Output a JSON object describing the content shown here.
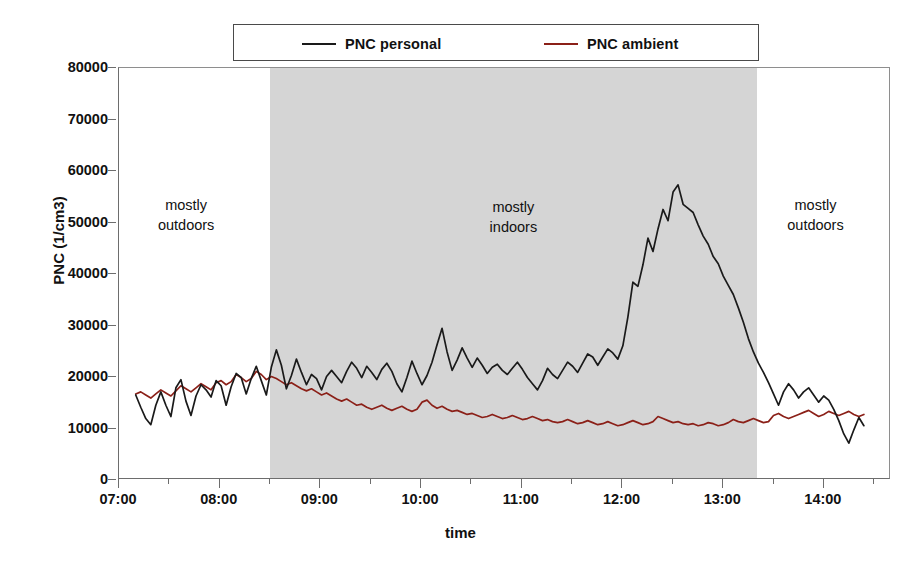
{
  "legend": {
    "entries": [
      {
        "label": "PNC personal",
        "color": "#1a1a1a"
      },
      {
        "label": "PNC ambient",
        "color": "#8b2018"
      }
    ]
  },
  "axes": {
    "y_title": "PNC (1/cm3)",
    "x_title": "time",
    "y_ticks": [
      "0",
      "10000",
      "20000",
      "30000",
      "40000",
      "50000",
      "60000",
      "70000",
      "80000"
    ],
    "x_ticks": [
      "07:00",
      "08:00",
      "09:00",
      "10:00",
      "11:00",
      "12:00",
      "13:00",
      "14:00"
    ]
  },
  "annotations": [
    {
      "line1": "mostly",
      "line2": "outdoors"
    },
    {
      "line1": "mostly",
      "line2": "indoors"
    },
    {
      "line1": "mostly",
      "line2": "outdoors"
    }
  ],
  "chart_data": {
    "type": "line",
    "title": "",
    "xlabel": "time",
    "ylabel": "PNC (1/cm3)",
    "ylim": [
      0,
      80000
    ],
    "xlim": [
      "07:00",
      "14:40"
    ],
    "grid": false,
    "legend_position": "top-center",
    "shaded_region": {
      "label": "mostly indoors",
      "start": "08:30",
      "end": "13:20",
      "color": "#d5d5d5"
    },
    "x_tick_interval_minutes": 60,
    "x_minor_tick_interval_minutes": 30,
    "y_tick_interval": 10000,
    "series": [
      {
        "name": "PNC personal",
        "color": "#1a1a1a",
        "x": [
          "07:10",
          "07:13",
          "07:16",
          "07:19",
          "07:22",
          "07:25",
          "07:28",
          "07:31",
          "07:34",
          "07:37",
          "07:40",
          "07:43",
          "07:46",
          "07:49",
          "07:52",
          "07:55",
          "07:58",
          "08:01",
          "08:04",
          "08:07",
          "08:10",
          "08:13",
          "08:16",
          "08:19",
          "08:22",
          "08:25",
          "08:28",
          "08:31",
          "08:34",
          "08:37",
          "08:40",
          "08:43",
          "08:46",
          "08:49",
          "08:52",
          "08:55",
          "08:58",
          "09:01",
          "09:04",
          "09:07",
          "09:10",
          "09:13",
          "09:16",
          "09:19",
          "09:22",
          "09:25",
          "09:28",
          "09:31",
          "09:34",
          "09:37",
          "09:40",
          "09:43",
          "09:46",
          "09:49",
          "09:52",
          "09:55",
          "09:58",
          "10:01",
          "10:04",
          "10:07",
          "10:10",
          "10:13",
          "10:16",
          "10:19",
          "10:22",
          "10:25",
          "10:28",
          "10:31",
          "10:34",
          "10:37",
          "10:40",
          "10:43",
          "10:46",
          "10:49",
          "10:52",
          "10:55",
          "10:58",
          "11:01",
          "11:04",
          "11:07",
          "11:10",
          "11:13",
          "11:16",
          "11:19",
          "11:22",
          "11:25",
          "11:28",
          "11:31",
          "11:34",
          "11:37",
          "11:40",
          "11:43",
          "11:46",
          "11:49",
          "11:52",
          "11:55",
          "11:58",
          "12:01",
          "12:04",
          "12:07",
          "12:10",
          "12:13",
          "12:16",
          "12:19",
          "12:22",
          "12:25",
          "12:28",
          "12:31",
          "12:34",
          "12:37",
          "12:40",
          "12:43",
          "12:46",
          "12:49",
          "12:52",
          "12:55",
          "12:58",
          "13:01",
          "13:04",
          "13:07",
          "13:10",
          "13:13",
          "13:16",
          "13:19",
          "13:22",
          "13:25",
          "13:28",
          "13:31",
          "13:34",
          "13:37",
          "13:40",
          "13:43",
          "13:46",
          "13:49",
          "13:52",
          "13:55",
          "13:58",
          "14:01",
          "14:04",
          "14:07",
          "14:10",
          "14:13",
          "14:16",
          "14:19",
          "14:22",
          "14:25"
        ],
        "y": [
          16200,
          13800,
          11600,
          10400,
          14200,
          16800,
          14200,
          12000,
          17600,
          19200,
          15000,
          12200,
          16000,
          18200,
          17200,
          15800,
          19000,
          18000,
          14200,
          17800,
          20400,
          19600,
          16400,
          19400,
          21800,
          19000,
          16200,
          21600,
          25000,
          22000,
          17400,
          20000,
          23200,
          20600,
          18200,
          20200,
          19400,
          17200,
          19800,
          21000,
          19800,
          18600,
          20800,
          22600,
          21400,
          19600,
          21800,
          20600,
          19200,
          21200,
          22400,
          20800,
          18400,
          16800,
          19600,
          22800,
          20400,
          18200,
          20000,
          22600,
          26000,
          29200,
          24600,
          21000,
          23000,
          25400,
          23400,
          21600,
          23400,
          22000,
          20400,
          21600,
          22200,
          21000,
          20200,
          21400,
          22600,
          21200,
          19600,
          18400,
          17200,
          19000,
          21400,
          20200,
          19400,
          21000,
          22600,
          21800,
          20600,
          22400,
          24200,
          23600,
          22000,
          23600,
          25200,
          24400,
          23200,
          25800,
          31400,
          38200,
          37400,
          41600,
          46800,
          44200,
          48600,
          52400,
          50200,
          55800,
          57200,
          53400,
          52600,
          51800,
          49400,
          47200,
          45600,
          43200,
          41800,
          39400,
          37600,
          35800,
          33200,
          30400,
          27200,
          24600,
          22400,
          20600,
          18600,
          16400,
          14200,
          16800,
          18400,
          17200,
          15600,
          16800,
          17600,
          16200,
          14800,
          16000,
          15200,
          13400,
          11200,
          8600,
          6800,
          9400,
          11800,
          10200
        ],
        "peak": {
          "time": "12:15",
          "value": 57200
        }
      },
      {
        "name": "PNC ambient",
        "color": "#8b2018",
        "x": [
          "07:10",
          "07:13",
          "07:16",
          "07:19",
          "07:22",
          "07:25",
          "07:28",
          "07:31",
          "07:34",
          "07:37",
          "07:40",
          "07:43",
          "07:46",
          "07:49",
          "07:52",
          "07:55",
          "07:58",
          "08:01",
          "08:04",
          "08:07",
          "08:10",
          "08:13",
          "08:16",
          "08:19",
          "08:22",
          "08:25",
          "08:28",
          "08:31",
          "08:34",
          "08:37",
          "08:40",
          "08:43",
          "08:46",
          "08:49",
          "08:52",
          "08:55",
          "08:58",
          "09:01",
          "09:04",
          "09:07",
          "09:10",
          "09:13",
          "09:16",
          "09:19",
          "09:22",
          "09:25",
          "09:28",
          "09:31",
          "09:34",
          "09:37",
          "09:40",
          "09:43",
          "09:46",
          "09:49",
          "09:52",
          "09:55",
          "09:58",
          "10:01",
          "10:04",
          "10:07",
          "10:10",
          "10:13",
          "10:16",
          "10:19",
          "10:22",
          "10:25",
          "10:28",
          "10:31",
          "10:34",
          "10:37",
          "10:40",
          "10:43",
          "10:46",
          "10:49",
          "10:52",
          "10:55",
          "10:58",
          "11:01",
          "11:04",
          "11:07",
          "11:10",
          "11:13",
          "11:16",
          "11:19",
          "11:22",
          "11:25",
          "11:28",
          "11:31",
          "11:34",
          "11:37",
          "11:40",
          "11:43",
          "11:46",
          "11:49",
          "11:52",
          "11:55",
          "11:58",
          "12:01",
          "12:04",
          "12:07",
          "12:10",
          "12:13",
          "12:16",
          "12:19",
          "12:22",
          "12:25",
          "12:28",
          "12:31",
          "12:34",
          "12:37",
          "12:40",
          "12:43",
          "12:46",
          "12:49",
          "12:52",
          "12:55",
          "12:58",
          "13:01",
          "13:04",
          "13:07",
          "13:10",
          "13:13",
          "13:16",
          "13:19",
          "13:22",
          "13:25",
          "13:28",
          "13:31",
          "13:34",
          "13:37",
          "13:40",
          "13:43",
          "13:46",
          "13:49",
          "13:52",
          "13:55",
          "13:58",
          "14:01",
          "14:04",
          "14:07",
          "14:10",
          "14:13",
          "14:16",
          "14:19",
          "14:22",
          "14:25"
        ],
        "y": [
          16400,
          16800,
          16200,
          15600,
          16400,
          17200,
          16600,
          16000,
          17000,
          18000,
          17400,
          16800,
          17600,
          18400,
          17800,
          17200,
          18600,
          19000,
          18200,
          18800,
          20200,
          19600,
          18800,
          19400,
          20800,
          20200,
          19200,
          19800,
          19400,
          18800,
          18200,
          18600,
          18000,
          17400,
          17000,
          17400,
          16800,
          16200,
          16600,
          16000,
          15400,
          15000,
          15400,
          14800,
          14200,
          14400,
          13800,
          13400,
          13800,
          14200,
          13600,
          13200,
          13600,
          14000,
          13400,
          13000,
          13400,
          14800,
          15200,
          14200,
          13600,
          14000,
          13400,
          13000,
          13200,
          12800,
          12400,
          12600,
          12200,
          11800,
          12000,
          12400,
          12000,
          11600,
          11800,
          12200,
          11800,
          11400,
          11600,
          12000,
          11600,
          11200,
          11400,
          11000,
          10800,
          11000,
          11400,
          11000,
          10600,
          10800,
          11200,
          10800,
          10400,
          10600,
          11000,
          10600,
          10200,
          10400,
          10800,
          11200,
          10800,
          10400,
          10600,
          11000,
          12000,
          11600,
          11200,
          10800,
          11000,
          10600,
          10400,
          10600,
          10200,
          10400,
          10800,
          10600,
          10200,
          10400,
          10800,
          11400,
          11000,
          10800,
          11200,
          11600,
          11200,
          10800,
          11000,
          12200,
          12600,
          12000,
          11600,
          12000,
          12400,
          12800,
          13200,
          12600,
          12000,
          12400,
          13000,
          12600,
          12200,
          12600,
          13000,
          12400,
          12000,
          12400
        ]
      }
    ]
  }
}
